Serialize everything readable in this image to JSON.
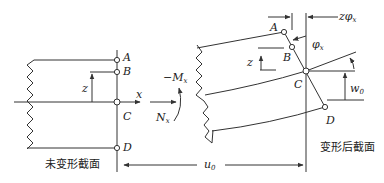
{
  "diagram": {
    "undeformed_section": {
      "caption": "未变形截面",
      "points": [
        "A",
        "B",
        "C",
        "D"
      ],
      "height_label": "z",
      "axis_label": "x"
    },
    "loads": {
      "moment_label": "−M",
      "moment_subscript": "x",
      "axial_label": "N",
      "axial_subscript": "x"
    },
    "deformed_section": {
      "caption": "变形后截面",
      "points": [
        "A",
        "B",
        "C",
        "D"
      ],
      "height_label": "z",
      "rotation_label": "φ",
      "rotation_subscript": "x",
      "offset_label": "zφ",
      "offset_subscript": "x",
      "vertical_disp_label": "w",
      "vertical_disp_subscript": "0"
    },
    "axial_displacement": {
      "label": "u",
      "subscript": "0"
    }
  }
}
